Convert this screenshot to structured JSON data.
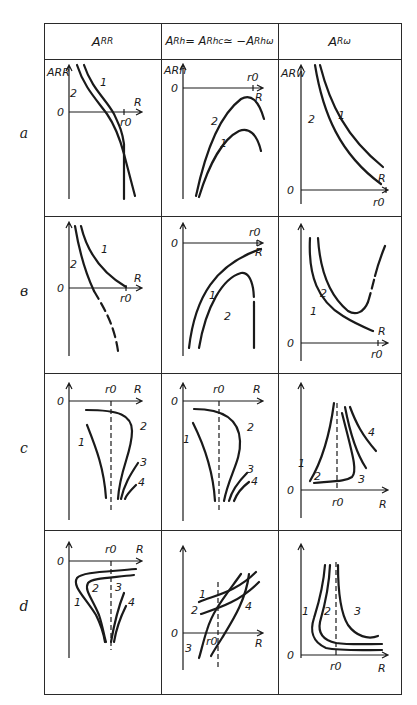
{
  "columns": [
    {
      "id": "ARR",
      "label": "A",
      "sub": "RR"
    },
    {
      "id": "ARh",
      "label": "A",
      "sub": "Rh",
      "eq": " = A",
      "sub2": "Rhc",
      "eq2": " ≃ −A",
      "sub3": "Rhω"
    },
    {
      "id": "ARw",
      "label": "A",
      "sub": "Rω"
    }
  ],
  "rows": [
    {
      "id": "a",
      "label": "a"
    },
    {
      "id": "b",
      "label": "в"
    },
    {
      "id": "c",
      "label": "c"
    },
    {
      "id": "d",
      "label": "d"
    }
  ],
  "axis_labels": {
    "origin": "0",
    "x": "R",
    "r0": "r0",
    "y_ARR": "ARR",
    "y_ARh": "ARh",
    "y_ARw": "ARw"
  },
  "curve_labels": {
    "one": "1",
    "two": "2",
    "three": "3",
    "four": "4"
  }
}
